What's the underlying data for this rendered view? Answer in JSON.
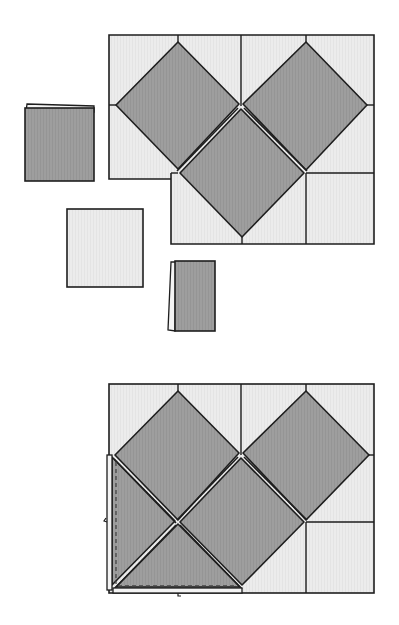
{
  "diagram": {
    "description": "Quilt-style tiling puzzle: dark grey squares rotated 45 degrees inside a grid of light squares, with loose folded pieces, and an assembled result below",
    "colors": {
      "background": "#ffffff",
      "light_tile": "#ececec",
      "dark_tile": "#9c9c9c",
      "outline": "#1e1e1e",
      "fold_flap": "#f4f4f4"
    },
    "panels": [
      {
        "id": "step-1",
        "label": "Pieces before assembly",
        "frame": {
          "grid_cols": 4,
          "grid_rows": 2,
          "dark_diamonds": 3
        },
        "loose_pieces": [
          {
            "name": "folded-dark-square-left",
            "fill": "dark",
            "folded_edge": "top"
          },
          {
            "name": "light-square",
            "fill": "light",
            "folded_edge": "none"
          },
          {
            "name": "folded-dark-square-bottom",
            "fill": "dark",
            "folded_edge": "left"
          }
        ]
      },
      {
        "id": "step-2",
        "label": "Assembled result",
        "frame": {
          "grid_cols": 4,
          "grid_rows": 2,
          "dark_diamonds": 4,
          "dark_triangles": 1
        },
        "annotations": [
          "dashed fold line along left edge",
          "dashed fold line along bottom edge"
        ]
      }
    ]
  }
}
